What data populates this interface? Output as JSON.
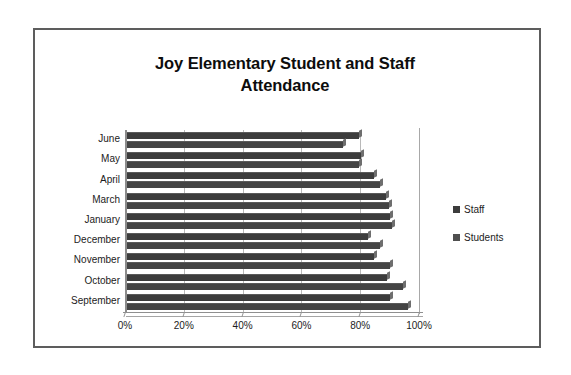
{
  "document": {
    "frame_border_color": "#5d5d5d",
    "background": "#ffffff"
  },
  "chart_data": {
    "type": "bar",
    "orientation": "horizontal",
    "title": "Joy Elementary Student and Staff Attendance",
    "title_line1": "Joy Elementary Student and Staff",
    "title_line2": "Attendance",
    "xlabel": "",
    "ylabel": "",
    "xlim": [
      0,
      100
    ],
    "xticks": [
      0,
      20,
      40,
      60,
      80,
      100
    ],
    "xtick_labels": [
      "0%",
      "20%",
      "40%",
      "60%",
      "80%",
      "100%"
    ],
    "grid": true,
    "grid_axis": "x",
    "legend_position": "right",
    "categories": [
      "June",
      "May",
      "April",
      "March",
      "January",
      "December",
      "November",
      "October",
      "September"
    ],
    "series": [
      {
        "name": "Staff",
        "color": "#3c3c3c",
        "values": [
          79.0,
          79.5,
          84.0,
          88.0,
          89.5,
          82.0,
          84.0,
          88.5,
          89.5
        ]
      },
      {
        "name": "Students",
        "color": "#444444",
        "values": [
          73.5,
          79.0,
          86.0,
          89.0,
          90.0,
          86.0,
          89.5,
          94.0,
          95.5
        ]
      }
    ]
  },
  "legend": {
    "items": [
      {
        "label": "Staff",
        "color": "#3c3c3c"
      },
      {
        "label": "Students",
        "color": "#4f4f4f"
      }
    ]
  }
}
